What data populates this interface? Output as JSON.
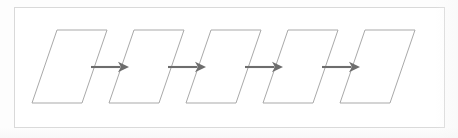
{
  "diagram": {
    "type": "flowchart",
    "orientation": "left-to-right",
    "canvas": {
      "width": 458,
      "height": 138,
      "background": "#fdfdfd"
    },
    "frame": {
      "name": "figure-border",
      "x": 14,
      "y": 7,
      "width": 431,
      "height": 121,
      "stroke": "#d9d9d9",
      "stroke_width": 1,
      "fill": "#ffffff"
    },
    "style": {
      "node_stroke": "#a9a9a9",
      "node_fill": "#ffffff",
      "node_stroke_width": 1,
      "arrow_color": "#6d6d6d",
      "arrow_stroke_width": 2.1
    },
    "node_shape": "parallelogram",
    "node_count": 5,
    "arrow_count": 4,
    "node_geometry": {
      "top_y": 30,
      "bottom_y": 103,
      "height": 73,
      "edge_width": 50,
      "slant_dx": 25,
      "pitch": 77,
      "first_bottom_left_x": 32
    },
    "nodes": [
      {
        "id": "node-1",
        "label": "",
        "bottom_left_x": 32,
        "order": 1
      },
      {
        "id": "node-2",
        "label": "",
        "bottom_left_x": 109,
        "order": 2
      },
      {
        "id": "node-3",
        "label": "",
        "bottom_left_x": 186,
        "order": 3
      },
      {
        "id": "node-4",
        "label": "",
        "bottom_left_x": 263,
        "order": 4
      },
      {
        "id": "node-5",
        "label": "",
        "bottom_left_x": 340,
        "order": 5
      }
    ],
    "arrows": [
      {
        "id": "arrow-1",
        "from": "node-1",
        "to": "node-2",
        "label": "",
        "y": 67,
        "x_start": 91,
        "x_end": 129
      },
      {
        "id": "arrow-2",
        "from": "node-2",
        "to": "node-3",
        "label": "",
        "y": 67,
        "x_start": 168,
        "x_end": 206
      },
      {
        "id": "arrow-3",
        "from": "node-3",
        "to": "node-4",
        "label": "",
        "y": 67,
        "x_start": 245,
        "x_end": 283
      },
      {
        "id": "arrow-4",
        "from": "node-4",
        "to": "node-5",
        "label": "",
        "y": 67,
        "x_start": 322,
        "x_end": 360
      }
    ]
  }
}
